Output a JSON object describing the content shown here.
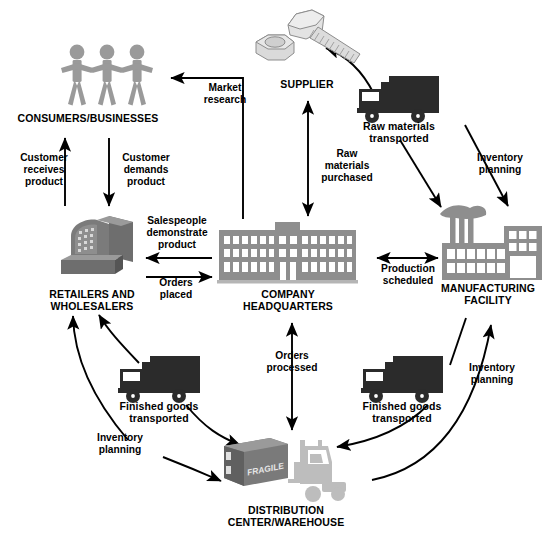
{
  "diagram": {
    "palette": {
      "background": "#ffffff",
      "arrow": "#000000",
      "text": "#000000",
      "people_gray": "#9a9a9a",
      "building_gray": "#8e8e8e",
      "building_dark": "#6e6e6e",
      "truck_dark": "#2b2b2b",
      "supplier_light": "#d6d6d6",
      "crate_gray": "#7a7a7a",
      "forklift_gray": "#bdbdbd",
      "window_white": "#ffffff"
    },
    "nodes": [
      {
        "id": "consumers",
        "label": "CONSUMERS/BUSINESSES",
        "icon": "three-people-icon"
      },
      {
        "id": "supplier",
        "label": "SUPPLIER",
        "icon": "bolt-and-nut-icon"
      },
      {
        "id": "truck_raw",
        "label": "Raw materials\ntransported",
        "icon": "delivery-truck-icon"
      },
      {
        "id": "manufacturing",
        "label": "MANUFACTURING\nFACILITY",
        "icon": "factory-icon"
      },
      {
        "id": "headquarters",
        "label": "COMPANY\nHEADQUARTERS",
        "icon": "office-building-icon"
      },
      {
        "id": "retailers",
        "label": "RETAILERS AND\nWHOLESALERS",
        "icon": "retail-store-icon"
      },
      {
        "id": "truck_left",
        "label": "Finished goods\ntransported",
        "icon": "delivery-truck-icon"
      },
      {
        "id": "truck_right",
        "label": "Finished goods\ntransported",
        "icon": "delivery-truck-icon"
      },
      {
        "id": "distribution",
        "label": "DISTRIBUTION\nCENTER/WAREHOUSE",
        "icon": "forklift-and-crate-icon"
      }
    ],
    "crate_text": "FRAGILE",
    "edges": [
      {
        "id": "market_research",
        "label": "Market\nresearch",
        "from": "headquarters",
        "to": "consumers",
        "style": "elbow"
      },
      {
        "id": "customer_receives",
        "label": "Customer\nreceives\nproduct",
        "from": "retailers",
        "to": "consumers",
        "style": "straight"
      },
      {
        "id": "customer_demands",
        "label": "Customer\ndemands\nproduct",
        "from": "consumers",
        "to": "retailers",
        "style": "straight"
      },
      {
        "id": "salespeople",
        "label": "Salespeople\ndemonstrate\nproduct",
        "from": "headquarters",
        "to": "retailers",
        "style": "straight"
      },
      {
        "id": "orders_placed",
        "label": "Orders\nplaced",
        "from": "retailers",
        "to": "headquarters",
        "style": "straight"
      },
      {
        "id": "raw_purchased",
        "label": "Raw\nmaterials\npurchased",
        "from": "headquarters",
        "to": "supplier",
        "style": "bidirectional"
      },
      {
        "id": "supplier_to_truck",
        "label": "",
        "from": "truck_raw",
        "to": "supplier",
        "style": "curve"
      },
      {
        "id": "truck_to_factory",
        "label": "",
        "from": "truck_raw",
        "to": "manufacturing",
        "style": "straight"
      },
      {
        "id": "inventory_top_right",
        "label": "Inventory\nplanning",
        "from": "truck_raw",
        "to": "manufacturing",
        "style": "straight"
      },
      {
        "id": "production_scheduled",
        "label": "Production\nscheduled",
        "from": "headquarters",
        "to": "manufacturing",
        "style": "bidirectional"
      },
      {
        "id": "orders_processed",
        "label": "Orders\nprocessed",
        "from": "headquarters",
        "to": "distribution",
        "style": "bidirectional"
      },
      {
        "id": "factory_to_truck_r",
        "label": "",
        "from": "manufacturing",
        "to": "truck_right",
        "style": "straight"
      },
      {
        "id": "truck_r_to_dist",
        "label": "",
        "from": "truck_right",
        "to": "distribution",
        "style": "curve"
      },
      {
        "id": "inventory_bot_right",
        "label": "Inventory\nplanning",
        "from": "distribution",
        "to": "manufacturing",
        "style": "curve"
      },
      {
        "id": "dist_to_truck_l",
        "label": "",
        "from": "truck_left",
        "to": "distribution",
        "style": "curve"
      },
      {
        "id": "truck_l_to_retail",
        "label": "",
        "from": "truck_left",
        "to": "retailers",
        "style": "curve"
      },
      {
        "id": "inventory_bot_left",
        "label": "Inventory\nplanning",
        "from": "distribution",
        "to": "retailers",
        "style": "curve"
      }
    ]
  }
}
